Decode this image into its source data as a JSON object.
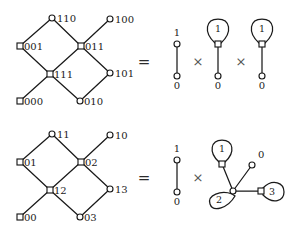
{
  "figure": {
    "rows": [
      {
        "id": "row-top",
        "relation_symbol": "=",
        "left_diagram": {
          "name": "binary-cube-lattice",
          "nodes": [
            {
              "id": "n110",
              "label": "110",
              "x": 52,
              "y": 18,
              "label_x": 57,
              "label_y": 22,
              "shape": "circle"
            },
            {
              "id": "n100",
              "label": "100",
              "x": 110,
              "y": 19,
              "label_x": 115,
              "label_y": 23,
              "shape": "circle"
            },
            {
              "id": "n001",
              "label": "001",
              "x": 20,
              "y": 46,
              "label_x": 25,
              "label_y": 50,
              "shape": "square"
            },
            {
              "id": "n011",
              "label": "011",
              "x": 81,
              "y": 46,
              "label_x": 86,
              "label_y": 50,
              "shape": "square"
            },
            {
              "id": "n111",
              "label": "111",
              "x": 50,
              "y": 74,
              "label_x": 55,
              "label_y": 78,
              "shape": "square"
            },
            {
              "id": "n101",
              "label": "101",
              "x": 110,
              "y": 73,
              "label_x": 115,
              "label_y": 77,
              "shape": "circle"
            },
            {
              "id": "n000",
              "label": "000",
              "x": 20,
              "y": 101,
              "label_x": 25,
              "label_y": 105,
              "shape": "square"
            },
            {
              "id": "n010",
              "label": "010",
              "x": 80,
              "y": 101,
              "label_x": 85,
              "label_y": 105,
              "shape": "circle"
            }
          ],
          "edges": [
            [
              "n110",
              "n001"
            ],
            [
              "n110",
              "n011"
            ],
            [
              "n100",
              "n011"
            ],
            [
              "n001",
              "n111"
            ],
            [
              "n011",
              "n111"
            ],
            [
              "n011",
              "n101"
            ],
            [
              "n111",
              "n000"
            ],
            [
              "n111",
              "n010"
            ],
            [
              "n101",
              "n010"
            ]
          ]
        },
        "right_factors": [
          {
            "name": "factor-edge-plain",
            "top_label": "1",
            "bottom_label": "0",
            "has_loop": false,
            "loop_label": "",
            "x": 177,
            "top_y": 44,
            "bottom_y": 76
          },
          {
            "name": "factor-edge-loop-a",
            "top_label": "",
            "bottom_label": "0",
            "has_loop": true,
            "loop_label": "1",
            "x": 218,
            "top_y": 44,
            "bottom_y": 76
          },
          {
            "name": "factor-edge-loop-b",
            "top_label": "",
            "bottom_label": "0",
            "has_loop": true,
            "loop_label": "1",
            "x": 262,
            "top_y": 44,
            "bottom_y": 76
          }
        ],
        "product_symbols": [
          {
            "label": "×",
            "x": 198,
            "y": 62
          },
          {
            "label": "×",
            "x": 241,
            "y": 62
          }
        ],
        "equals_position": {
          "x": 144,
          "y": 62
        }
      },
      {
        "id": "row-bottom",
        "relation_symbol": "=",
        "left_diagram": {
          "name": "base4-lattice",
          "nodes": [
            {
              "id": "m11",
              "label": "11",
              "x": 52,
              "y": 134,
              "label_x": 57,
              "label_y": 138,
              "shape": "circle"
            },
            {
              "id": "m10",
              "label": "10",
              "x": 110,
              "y": 135,
              "label_x": 115,
              "label_y": 139,
              "shape": "circle"
            },
            {
              "id": "m01",
              "label": "01",
              "x": 20,
              "y": 162,
              "label_x": 25,
              "label_y": 166,
              "shape": "square"
            },
            {
              "id": "m02",
              "label": "02",
              "x": 81,
              "y": 162,
              "label_x": 86,
              "label_y": 166,
              "shape": "square"
            },
            {
              "id": "m12",
              "label": "12",
              "x": 50,
              "y": 190,
              "label_x": 55,
              "label_y": 194,
              "shape": "square"
            },
            {
              "id": "m13",
              "label": "13",
              "x": 110,
              "y": 189,
              "label_x": 115,
              "label_y": 193,
              "shape": "circle"
            },
            {
              "id": "m00",
              "label": "00",
              "x": 20,
              "y": 217,
              "label_x": 25,
              "label_y": 221,
              "shape": "square"
            },
            {
              "id": "m03",
              "label": "03",
              "x": 80,
              "y": 217,
              "label_x": 85,
              "label_y": 221,
              "shape": "circle"
            }
          ],
          "edges": [
            [
              "m11",
              "m01"
            ],
            [
              "m11",
              "m02"
            ],
            [
              "m10",
              "m02"
            ],
            [
              "m01",
              "m12"
            ],
            [
              "m02",
              "m12"
            ],
            [
              "m02",
              "m13"
            ],
            [
              "m12",
              "m00"
            ],
            [
              "m12",
              "m03"
            ],
            [
              "m13",
              "m03"
            ]
          ]
        },
        "right_factors": [
          {
            "name": "factor-edge-plain",
            "top_label": "1",
            "bottom_label": "0",
            "has_loop": false,
            "loop_label": "",
            "x": 177,
            "top_y": 160,
            "bottom_y": 192
          }
        ],
        "star_graph": {
          "name": "star-graph-with-loops",
          "hub": {
            "id": "hub",
            "x": 233,
            "y": 191,
            "shape": "square"
          },
          "leaves": [
            {
              "id": "leaf1",
              "label": "1",
              "x": 222,
              "y": 163,
              "shape": "square",
              "has_loop": true,
              "loop_label": "1",
              "loop_dir": "up",
              "loop_label_x": 222,
              "loop_label_y": 151
            },
            {
              "id": "leaf0",
              "label": "0",
              "x": 252,
              "y": 163,
              "shape": "circle",
              "has_loop": false,
              "loop_label": "",
              "loop_dir": "",
              "label_x": 259,
              "label_y": 158
            },
            {
              "id": "leaf2",
              "label": "2",
              "x": 233,
              "y": 191,
              "shape": "loop-only",
              "has_loop": true,
              "loop_label": "2",
              "loop_dir": "down-left",
              "loop_label_x": 219,
              "loop_label_y": 203
            },
            {
              "id": "leaf3",
              "label": "3",
              "x": 261,
              "y": 191,
              "shape": "square",
              "has_loop": true,
              "loop_label": "3",
              "loop_dir": "right",
              "loop_label_x": 272,
              "loop_label_y": 194
            }
          ],
          "edges": [
            [
              "hub",
              "leaf1"
            ],
            [
              "hub",
              "leaf0"
            ],
            [
              "hub",
              "leaf3"
            ]
          ]
        },
        "product_symbols": [
          {
            "label": "×",
            "x": 198,
            "y": 178
          }
        ],
        "equals_position": {
          "x": 144,
          "y": 178
        }
      }
    ]
  }
}
